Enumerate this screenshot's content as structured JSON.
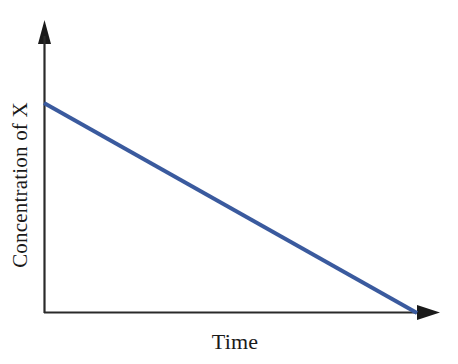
{
  "chart_data": {
    "type": "line",
    "title": "",
    "subtitle": "",
    "xlabel": "Time",
    "ylabel": "Concentration of X",
    "grid": false,
    "legend": false,
    "legend_position": "none",
    "xlim": [
      0,
      1
    ],
    "ylim": [
      0,
      1
    ],
    "xticks": [],
    "yticks": [],
    "xticklabels": [],
    "yticklabels": [],
    "annotations": [],
    "series": [
      {
        "name": "Concentration of X",
        "color": "#3a5a9e",
        "linewidth": 4,
        "x": [
          0.0,
          0.1,
          0.2,
          0.3,
          0.4,
          0.5,
          0.6,
          0.7,
          0.8,
          0.9,
          1.0
        ],
        "values": [
          1.0,
          0.9,
          0.8,
          0.7,
          0.6,
          0.5,
          0.4,
          0.3,
          0.2,
          0.1,
          0.0
        ],
        "description": "Straight line decreasing linearly from a high initial concentration at time zero to zero concentration at the right end of the time axis (zero-order decay)."
      }
    ]
  },
  "axes": {
    "x_axis_name": "time-axis",
    "y_axis_name": "concentration-axis",
    "arrowheads": true,
    "axis_color": "#1a1a1a",
    "origin": [
      44,
      313
    ],
    "x_axis_end": [
      440,
      313
    ],
    "y_axis_end": [
      45,
      20
    ]
  },
  "labels": {
    "y_axis": "Concentration of X",
    "x_axis": "Time"
  },
  "colors": {
    "background": "#ffffff",
    "line": "#3a5a9e",
    "axis": "#1a1a1a",
    "text": "#1a1a1a"
  }
}
